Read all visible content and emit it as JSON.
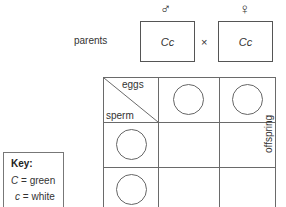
{
  "diagram": {
    "title_type": "punnett-square-genetic-cross",
    "parents": {
      "label": "parents",
      "male": {
        "symbol": "♂",
        "symbol_name": "male-symbol",
        "genotype": "Cc"
      },
      "female": {
        "symbol": "♀",
        "symbol_name": "female-symbol",
        "genotype": "Cc"
      },
      "cross_symbol": "×"
    },
    "punnett": {
      "eggs_label": "eggs",
      "sperm_label": "sperm",
      "offspring_label": "offspring",
      "columns": 3,
      "rows": 3,
      "gamete_circles": {
        "eggs": [
          "",
          ""
        ],
        "sperm": [
          "",
          ""
        ]
      }
    },
    "key": {
      "title": "Key:",
      "entries": [
        {
          "allele": "C",
          "equals": "=",
          "phenotype": "green"
        },
        {
          "allele": "c",
          "equals": "=",
          "phenotype": "white"
        }
      ]
    }
  },
  "colors": {
    "background": "#ffffff",
    "line": "#6a6a6a",
    "box_border": "#555555",
    "text": "#333333"
  }
}
